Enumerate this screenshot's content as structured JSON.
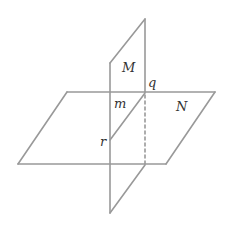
{
  "diagram": {
    "type": "intersecting-planes",
    "stroke_color": "#999999",
    "label_color": "#333333",
    "planes": [
      {
        "name": "M",
        "label": "M",
        "orientation": "vertical"
      },
      {
        "name": "N",
        "label": "N",
        "orientation": "horizontal"
      }
    ],
    "points": [
      {
        "name": "q",
        "label": "q"
      },
      {
        "name": "r",
        "label": "r"
      }
    ],
    "lines": [
      {
        "name": "m",
        "label": "m",
        "description": "intersection line of planes M and N, from q to r"
      }
    ],
    "labels": {
      "M": "M",
      "N": "N",
      "q": "q",
      "m": "m",
      "r": "r"
    }
  }
}
